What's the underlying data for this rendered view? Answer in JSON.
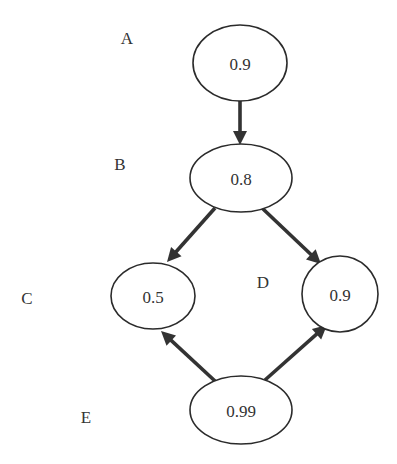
{
  "diagram": {
    "type": "directed-graph",
    "nodes": [
      {
        "id": "A",
        "label": "A",
        "value": "0.9"
      },
      {
        "id": "B",
        "label": "B",
        "value": "0.8"
      },
      {
        "id": "C",
        "label": "C",
        "value": "0.5"
      },
      {
        "id": "D",
        "label": "D",
        "value": "0.9"
      },
      {
        "id": "E",
        "label": "E",
        "value": "0.99"
      }
    ],
    "edges": [
      {
        "from": "A",
        "to": "B"
      },
      {
        "from": "B",
        "to": "C"
      },
      {
        "from": "B",
        "to": "D"
      },
      {
        "from": "E",
        "to": "C"
      },
      {
        "from": "E",
        "to": "D"
      }
    ],
    "colors": {
      "stroke": "#2b2b2b",
      "text": "#333333",
      "background": "#ffffff"
    }
  }
}
